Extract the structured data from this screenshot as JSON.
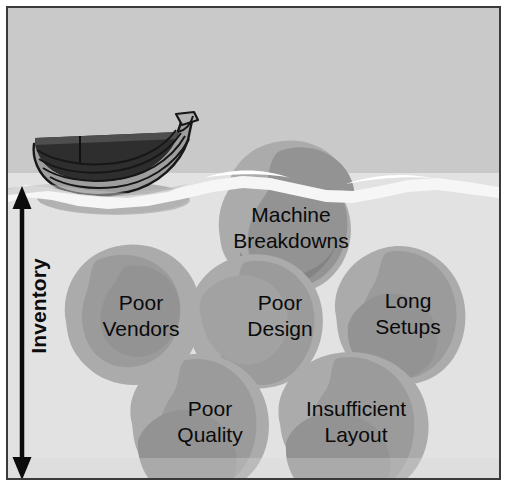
{
  "diagram": {
    "axis": {
      "label": "Inventory",
      "icon": "double-headed-vertical-arrow-icon",
      "direction": "both"
    },
    "vessel": {
      "icon": "rowboat-icon",
      "name": "boat"
    },
    "waterline": {
      "icon": "water-surface-icon"
    },
    "rocks": [
      {
        "id": "machine-breakdowns",
        "label": "Machine\nBreakdowns",
        "x": 280,
        "y": 213,
        "above_water": true
      },
      {
        "id": "poor-vendors",
        "label": "Poor\nVendors",
        "x": 133,
        "y": 315,
        "above_water": false
      },
      {
        "id": "poor-design",
        "label": "Poor\nDesign",
        "x": 272,
        "y": 315,
        "above_water": false
      },
      {
        "id": "long-setups",
        "label": "Long\nSetups",
        "x": 400,
        "y": 313,
        "above_water": false
      },
      {
        "id": "poor-quality",
        "label": "Poor\nQuality",
        "x": 202,
        "y": 420,
        "above_water": false
      },
      {
        "id": "insufficient-layout",
        "label": "Insufficient\nLayout",
        "x": 348,
        "y": 420,
        "above_water": false
      }
    ],
    "colors": {
      "sky": "#c9c9c9",
      "water": "#e2e2e2",
      "water_highlight": "#f6f6f6",
      "rock_light": "#ababab",
      "rock_dark": "#939393",
      "rock_darkest": "#848484",
      "boat_hull": "#9e9e9e",
      "boat_interior": "#2e2e2e",
      "outline": "#1a1a1a",
      "frame": "#3a3a3a",
      "text": "#0a0a0a"
    }
  }
}
